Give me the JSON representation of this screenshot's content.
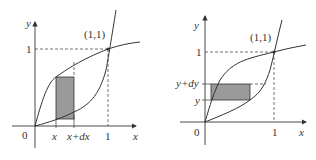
{
  "figures": [
    {
      "id": "left",
      "description": "Vertical strip between curves y=x^(1/3)-like (upper) and y=x^3-like (lower), integration in x",
      "axis_x_label": "x",
      "axis_y_label": "y",
      "origin_label": "0",
      "y_tick_label": "1",
      "x_tick_labels": [
        "x",
        "x+dx",
        "1"
      ],
      "point_label": "(1,1)"
    },
    {
      "id": "right",
      "description": "Horizontal strip between curves, integration in y",
      "axis_x_label": "x",
      "axis_y_label": "y",
      "origin_label": "0",
      "x_tick_label": "1",
      "y_tick_labels": [
        "y+dy",
        "y",
        "1"
      ],
      "point_label": "(1,1)"
    }
  ],
  "colors": {
    "stroke": "#333333",
    "strip_fill": "#9a9a9a"
  }
}
